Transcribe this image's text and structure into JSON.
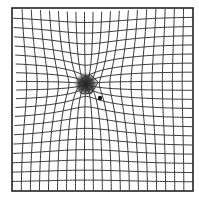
{
  "figure": {
    "type": "amsler-grid",
    "grid": {
      "x0": 12,
      "y0": 8,
      "x1": 193,
      "y1": 191,
      "cols": 20,
      "rows": 20,
      "line_color": "#3a3a3a",
      "border_color": "#222222",
      "line_width": 1.0,
      "border_width": 1.6
    },
    "distortion": {
      "center_x": 86,
      "center_y": 84,
      "strength": 14,
      "radius": 48
    },
    "scotoma": {
      "cx": 86,
      "cy": 84,
      "r": 12,
      "color": "#2b2b2b"
    },
    "fixation_dot": {
      "cx": 100,
      "cy": 98,
      "r": 2.2,
      "color": "#111111"
    },
    "colors": {
      "background": "#ffffff"
    }
  }
}
